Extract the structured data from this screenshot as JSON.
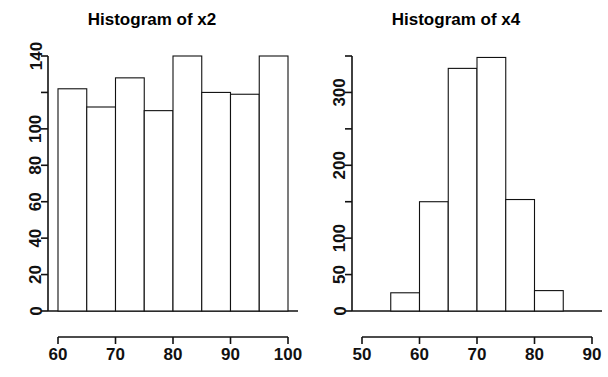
{
  "figure": {
    "background": "#ffffff",
    "foreground": "#111111",
    "panel_count": 2
  },
  "chart_data": [
    {
      "type": "bar",
      "title": "Histogram of x2",
      "xlabel": "",
      "ylabel": "",
      "grid": false,
      "legend": null,
      "bin_width": 5,
      "bin_edges": [
        60,
        65,
        70,
        75,
        80,
        85,
        90,
        95,
        100
      ],
      "categories": [
        "60-65",
        "65-70",
        "70-75",
        "75-80",
        "80-85",
        "85-90",
        "90-95",
        "95-100"
      ],
      "values": [
        122,
        112,
        128,
        110,
        140,
        120,
        119,
        140
      ],
      "xlim": [
        60,
        100
      ],
      "ylim": [
        0,
        140
      ],
      "xticks": [
        60,
        70,
        80,
        90,
        100
      ],
      "xticklabels": [
        "60",
        "70",
        "80",
        "90",
        "100"
      ],
      "yticks": [
        0,
        20,
        40,
        60,
        80,
        100,
        120,
        140
      ],
      "yticklabels": [
        "0",
        "20",
        "40",
        "60",
        "80",
        "100",
        "",
        "140"
      ]
    },
    {
      "type": "bar",
      "title": "Histogram of x4",
      "xlabel": "",
      "ylabel": "",
      "grid": false,
      "legend": null,
      "bin_width": 5,
      "bin_edges": [
        55,
        60,
        65,
        70,
        75,
        80,
        85
      ],
      "categories": [
        "55-60",
        "60-65",
        "65-70",
        "70-75",
        "75-80",
        "80-85"
      ],
      "values": [
        25,
        150,
        333,
        348,
        153,
        28
      ],
      "xlim": [
        50,
        90
      ],
      "ylim": [
        0,
        350
      ],
      "xticks": [
        50,
        60,
        70,
        80,
        90
      ],
      "xticklabels": [
        "50",
        "60",
        "70",
        "80",
        "90"
      ],
      "yticks": [
        0,
        50,
        100,
        150,
        200,
        250,
        300,
        350
      ],
      "yticklabels": [
        "0",
        "50",
        "100",
        "",
        "200",
        "",
        "300",
        ""
      ]
    }
  ]
}
